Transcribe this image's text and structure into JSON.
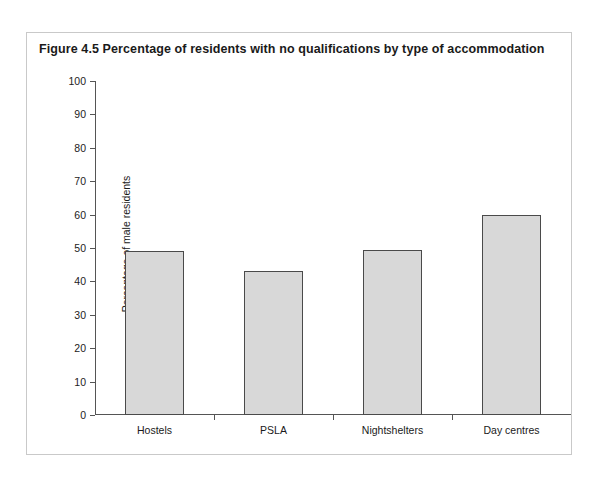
{
  "figure": {
    "title": "Figure 4.5  Percentage of residents with no qualifications by type of accommodation"
  },
  "chart_data": {
    "type": "bar",
    "title": "Figure 4.5  Percentage of residents with no qualifications by type of accommodation",
    "categories": [
      "Hostels",
      "PSLA",
      "Nightshelters",
      "Day centres"
    ],
    "values": [
      49,
      43,
      49.5,
      60
    ],
    "xlabel": "",
    "ylabel": "Percentage of male residents",
    "ylim": [
      0,
      100
    ],
    "ytick_step": 10,
    "yticks": [
      0,
      10,
      20,
      30,
      40,
      50,
      60,
      70,
      80,
      90,
      100
    ],
    "ytick_labels": [
      "0",
      "10",
      "20",
      "30",
      "40",
      "50",
      "60",
      "70",
      "80",
      "90",
      "100"
    ],
    "grid": false,
    "legend": false,
    "bar_fill_color": "#d8d8d8",
    "bar_edge_color": "#4a4a4a",
    "axis_color": "#555555",
    "background_color": "#ffffff"
  }
}
